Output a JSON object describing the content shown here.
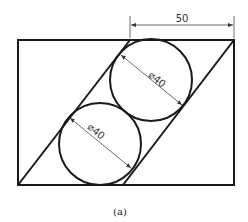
{
  "figure": {
    "caption": "(a)",
    "dimensions": {
      "width_label": "50",
      "upper_circle_label": "⌀40",
      "lower_circle_label": "⌀40"
    },
    "colors": {
      "stroke": "#1a1a1a",
      "dim": "#444444",
      "background": "#ffffff"
    }
  }
}
